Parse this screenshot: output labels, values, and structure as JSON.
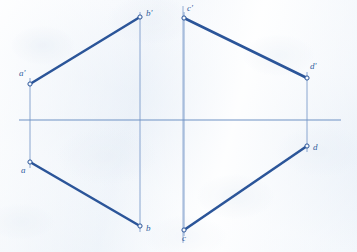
{
  "drawing": {
    "title": "Orthographic projection of two lines AB and CD",
    "sheet": {
      "width": 357,
      "height": 252,
      "background_color": "#f2f6fb"
    },
    "colors": {
      "object_line": "#2b5599",
      "projector_line": "#7d9ccb",
      "ground_line": "#6f92c4",
      "label_text": "#31609e",
      "point_marker_fill": "#f4f8fc"
    },
    "reference_lines": {
      "ground_line": {
        "name": "xy-ground-line",
        "label": "",
        "x1": 19,
        "y1": 120,
        "x2": 341,
        "y2": 120
      },
      "vertical_axis": {
        "name": "center-vertical-axis",
        "x1": 183,
        "y1": 6,
        "x2": 183,
        "y2": 243
      }
    },
    "projectors": [
      {
        "name": "projector-a",
        "x": 30,
        "y1": 78,
        "y2": 168
      },
      {
        "name": "projector-b",
        "x": 140,
        "y1": 12,
        "y2": 232
      },
      {
        "name": "projector-c",
        "x": 184,
        "y1": 12,
        "y2": 236
      },
      {
        "name": "projector-d",
        "x": 307,
        "y1": 72,
        "y2": 152
      }
    ],
    "segments": [
      {
        "name": "segment-a-prime-b-prime",
        "view": "front view",
        "from": "a'",
        "to": "b'",
        "x1": 30,
        "y1": 84,
        "x2": 140,
        "y2": 17
      },
      {
        "name": "segment-a-b",
        "view": "top view",
        "from": "a",
        "to": "b",
        "x1": 30,
        "y1": 162,
        "x2": 140,
        "y2": 226
      },
      {
        "name": "segment-c-prime-d-prime",
        "view": "front view",
        "from": "c'",
        "to": "d'",
        "x1": 184,
        "y1": 18,
        "x2": 307,
        "y2": 78
      },
      {
        "name": "segment-c-d",
        "view": "top view",
        "from": "c",
        "to": "d",
        "x1": 184,
        "y1": 230,
        "x2": 307,
        "y2": 146
      }
    ],
    "points": [
      {
        "id": "a-prime",
        "label": "a'",
        "x": 30,
        "y": 84,
        "label_x": 19,
        "label_y": 69,
        "view": "front"
      },
      {
        "id": "b-prime",
        "label": "b'",
        "x": 140,
        "y": 17,
        "label_x": 146,
        "label_y": 9,
        "view": "front"
      },
      {
        "id": "a",
        "label": "a",
        "x": 30,
        "y": 162,
        "label_x": 21,
        "label_y": 166,
        "view": "top"
      },
      {
        "id": "b",
        "label": "b",
        "x": 140,
        "y": 226,
        "label_x": 146,
        "label_y": 224,
        "view": "top"
      },
      {
        "id": "c-prime",
        "label": "c'",
        "x": 184,
        "y": 18,
        "label_x": 187,
        "label_y": 4,
        "view": "front"
      },
      {
        "id": "d-prime",
        "label": "d'",
        "x": 307,
        "y": 78,
        "label_x": 310,
        "label_y": 62,
        "view": "front"
      },
      {
        "id": "c",
        "label": "c",
        "x": 184,
        "y": 230,
        "label_x": 182,
        "label_y": 234,
        "view": "top"
      },
      {
        "id": "d",
        "label": "d",
        "x": 307,
        "y": 146,
        "label_x": 313,
        "label_y": 143,
        "view": "top"
      }
    ]
  }
}
